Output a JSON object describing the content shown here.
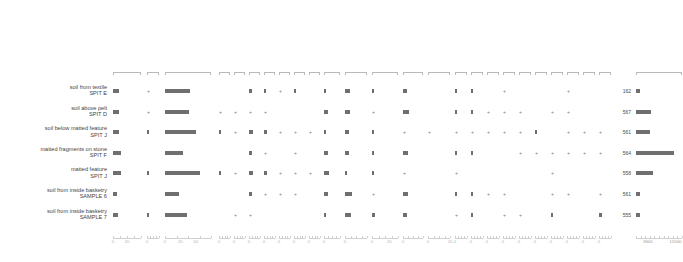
{
  "chart_data": {
    "type": "bar",
    "title": "",
    "subtitle": "",
    "xlabel": "",
    "ylabel": "",
    "grid": false,
    "legend": "none",
    "sample_header": "SAMPLE",
    "samples": [
      {
        "line1": "soil from textile",
        "line2": "SPIT E",
        "sum_total": "162"
      },
      {
        "line1": "soil above pelt",
        "line2": "SPIT D",
        "sum_total": "567"
      },
      {
        "line1": "soil below matted feature",
        "line2": "SPIT J",
        "sum_total": "561"
      },
      {
        "line1": "matted fragments on stone",
        "line2": "SPIT F",
        "sum_total": "564"
      },
      {
        "line1": "matted feature",
        "line2": "SPIT J",
        "sum_total": "558"
      },
      {
        "line1": "soil from inside basketry",
        "line2": "SAMPLE  6",
        "sum_total": "561"
      },
      {
        "line1": "soil from inside basketry",
        "line2": "SAMPLE 7",
        "sum_total": "555"
      }
    ],
    "taxa": [
      {
        "name": "Alnus",
        "units": "",
        "group": "trees",
        "xmax": 40,
        "ticks": [
          0,
          20
        ],
        "tick_labels": [
          "0",
          "20"
        ],
        "values": [
          9,
          8,
          9,
          12,
          11,
          6,
          7
        ]
      },
      {
        "name": "Betula",
        "units": "",
        "group": "trees",
        "xmax": 40,
        "ticks": [
          0
        ],
        "tick_labels": [
          "0"
        ],
        "values": [
          0.4,
          0.4,
          1.6,
          0,
          1.6,
          0,
          1.6
        ]
      },
      {
        "name": "Corylus",
        "units": "",
        "group": "trees",
        "xmax": 60,
        "ticks": [
          0,
          20,
          40
        ],
        "tick_labels": [
          "0",
          "20",
          "40"
        ],
        "values": [
          32,
          31,
          40,
          24,
          45,
          18,
          29
        ]
      },
      {
        "name": "Fraxinus",
        "units": "",
        "group": "trees",
        "xmax": 10,
        "ticks": [
          0
        ],
        "tick_labels": [
          "0"
        ],
        "values": [
          0,
          0.6,
          1.6,
          0,
          1.6,
          0,
          0
        ]
      },
      {
        "name": "Pinus",
        "units": "",
        "group": "trees",
        "xmax": 10,
        "ticks": [
          0
        ],
        "tick_labels": [
          "0"
        ],
        "values": [
          0,
          0.6,
          0.6,
          0,
          0.6,
          0,
          0.6
        ]
      },
      {
        "name": "Prunus spinosa",
        "units": "",
        "group": "trees",
        "xmax": 10,
        "ticks": [
          0
        ],
        "tick_labels": [
          "0"
        ],
        "values": [
          2.5,
          0.4,
          3.6,
          2.5,
          3.6,
          2.5,
          0.6
        ]
      },
      {
        "name": "Quercus",
        "units": "",
        "group": "trees",
        "xmax": 10,
        "ticks": [
          0
        ],
        "tick_labels": [
          "0"
        ],
        "values": [
          1.8,
          0.6,
          2.8,
          0.6,
          2.8,
          0.6,
          0
        ]
      },
      {
        "name": "Salix",
        "units": "",
        "group": "trees",
        "xmax": 10,
        "ticks": [
          0
        ],
        "tick_labels": [
          "0"
        ],
        "values": [
          0.6,
          0,
          0.6,
          0,
          0.6,
          0.4,
          0
        ]
      },
      {
        "name": "Tilia",
        "units": "",
        "group": "trees",
        "xmax": 10,
        "ticks": [
          0
        ],
        "tick_labels": [
          "0"
        ],
        "values": [
          1.2,
          0,
          0.6,
          0.6,
          0.6,
          0.3,
          0
        ]
      },
      {
        "name": "Ulmus",
        "units": "",
        "group": "trees",
        "xmax": 10,
        "ticks": [
          0
        ],
        "tick_labels": [
          "0"
        ],
        "values": [
          0,
          0,
          0.6,
          0,
          0.6,
          0,
          0
        ]
      },
      {
        "name": "Hedera helix",
        "units": "",
        "group": "shrubs",
        "xmax": 10,
        "ticks": [
          0
        ],
        "tick_labels": [
          "0"
        ],
        "values": [
          1.2,
          2.6,
          0.9,
          2.6,
          3.4,
          2.6,
          1.2
        ]
      },
      {
        "name": "Calluna vulgaris",
        "units": "",
        "group": "shrubs",
        "xmax": 20,
        "ticks": [
          0
        ],
        "tick_labels": [
          "0"
        ],
        "values": [
          4.5,
          4.5,
          3.2,
          4.0,
          2.0,
          6.0,
          5.5
        ]
      },
      {
        "name": "Poaceae",
        "units": "",
        "group": "herbs",
        "xmax": 30,
        "ticks": [
          0,
          20
        ],
        "tick_labels": [
          "0",
          "20"
        ],
        "values": [
          1.0,
          0.4,
          2.8,
          1.6,
          1.6,
          0.4,
          3.0
        ]
      },
      {
        "name": "Cyperaceae",
        "units": "",
        "group": "herbs",
        "xmax": 20,
        "ticks": [
          0
        ],
        "tick_labels": [
          "0"
        ],
        "values": [
          4.0,
          5.5,
          0.6,
          5.0,
          0.4,
          4.5,
          4.0
        ]
      },
      {
        "name": "Filipendula",
        "units": "",
        "group": "herbs",
        "xmax": 20,
        "ticks": [
          0,
          20
        ],
        "tick_labels": [
          "0",
          "20"
        ],
        "values": [
          0,
          0,
          0.4,
          0,
          0,
          0,
          0
        ]
      },
      {
        "name": "Lactuceae",
        "units": "",
        "group": "herbs",
        "xmax": 10,
        "ticks": [
          0
        ],
        "tick_labels": [
          "0"
        ],
        "values": [
          1.6,
          1.6,
          0.6,
          1.6,
          0.4,
          1.6,
          0.4
        ]
      },
      {
        "name": "Plantago lanceolata",
        "units": "",
        "group": "herbs",
        "xmax": 10,
        "ticks": [
          0
        ],
        "tick_labels": [
          "0"
        ],
        "values": [
          1.6,
          1.6,
          0.6,
          1.2,
          0,
          0.9,
          0.9
        ]
      },
      {
        "name": "Potentilla type",
        "units": "",
        "group": "herbs",
        "xmax": 10,
        "ticks": [
          0
        ],
        "tick_labels": [
          "0"
        ],
        "values": [
          0,
          0.4,
          0.6,
          0,
          0,
          0.6,
          0
        ]
      },
      {
        "name": "Ranunculus",
        "units": "",
        "group": "herbs",
        "xmax": 10,
        "ticks": [
          0
        ],
        "tick_labels": [
          "0"
        ],
        "values": [
          0.6,
          0.4,
          0.6,
          0,
          0,
          0.6,
          0.6
        ]
      },
      {
        "name": "Rumex acetosa",
        "units": "",
        "group": "herbs",
        "xmax": 10,
        "ticks": [
          0
        ],
        "tick_labels": [
          "0"
        ],
        "values": [
          0,
          0.4,
          0.6,
          0.4,
          0,
          0,
          0.4
        ]
      },
      {
        "name": "Urtica",
        "units": "",
        "group": "herbs",
        "xmax": 10,
        "ticks": [
          0
        ],
        "tick_labels": [
          "0"
        ],
        "values": [
          0,
          0,
          1.5,
          0.4,
          0,
          0,
          0
        ]
      },
      {
        "name": "Polypodium",
        "units": "",
        "group": "spores",
        "xmax": 10,
        "ticks": [
          0
        ],
        "tick_labels": [
          "0"
        ],
        "values": [
          0,
          0.6,
          0,
          0.4,
          0.6,
          0.6,
          1.0
        ]
      },
      {
        "name": "Pteridium",
        "units": "",
        "group": "spores",
        "xmax": 10,
        "ticks": [
          0
        ],
        "tick_labels": [
          "0"
        ],
        "values": [
          0.4,
          0.6,
          0.6,
          0.4,
          0,
          0.6,
          0
        ]
      },
      {
        "name": "Pteropsida",
        "units": "",
        "group": "spores",
        "xmax": 10,
        "ticks": [
          0
        ],
        "tick_labels": [
          "0"
        ],
        "values": [
          0,
          0,
          0.6,
          0.4,
          0,
          0,
          0
        ]
      },
      {
        "name": "Sphagnum",
        "units": "",
        "group": "spores",
        "xmax": 10,
        "ticks": [
          0
        ],
        "tick_labels": [
          "0"
        ],
        "values": [
          0,
          0,
          0.6,
          0.4,
          0,
          0.6,
          2.2
        ]
      },
      {
        "name": "Sum Total Land Pollen",
        "units": "",
        "group": "sum",
        "xmax": 0,
        "ticks": [],
        "tick_labels": [],
        "values": []
      },
      {
        "name": "pollen concentration",
        "units": "(grains cm-3)",
        "group": "conc",
        "xmax": 14000,
        "ticks": [
          3600,
          12000
        ],
        "tick_labels": [
          "3600",
          "12000"
        ],
        "values": [
          1200,
          4600,
          4400,
          11500,
          5200,
          1200,
          1200
        ]
      }
    ]
  }
}
